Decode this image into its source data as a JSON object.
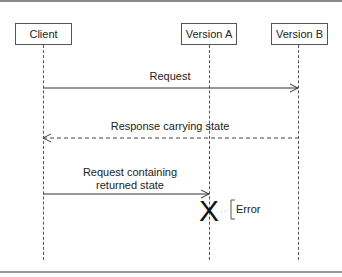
{
  "diagram": {
    "type": "sequence",
    "participants": [
      {
        "id": "client",
        "label": "Client"
      },
      {
        "id": "version_a",
        "label": "Version A"
      },
      {
        "id": "version_b",
        "label": "Version B"
      }
    ],
    "messages": [
      {
        "from": "client",
        "to": "version_b",
        "label": "Request",
        "style": "solid"
      },
      {
        "from": "version_b",
        "to": "client",
        "label": "Response carrying state",
        "style": "dashed"
      },
      {
        "from": "client",
        "to": "version_a",
        "label_line1": "Request containing",
        "label_line2": "returned state",
        "style": "solid"
      }
    ],
    "termination": {
      "participant": "version_a",
      "glyph": "X",
      "annotation": "Error"
    }
  }
}
